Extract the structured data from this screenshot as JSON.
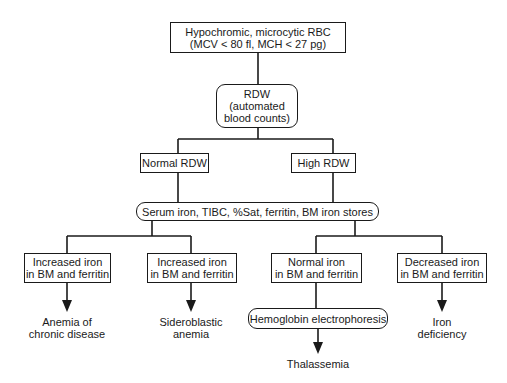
{
  "diagram": {
    "root": {
      "line1": "Hypochromic, microcytic RBC",
      "line2": "(MCV < 80 fl, MCH < 27 pg)"
    },
    "rdw": {
      "line1": "RDW",
      "line2": "(automated",
      "line3": "blood counts)"
    },
    "branches": {
      "normal": "Normal RDW",
      "high": "High RDW"
    },
    "tests": "Serum iron, TIBC, %Sat, ferritin, BM iron stores",
    "findings": [
      {
        "line1": "Increased iron",
        "line2": "in BM and ferritin",
        "outcome_line1": "Anemia of",
        "outcome_line2": "chronic disease"
      },
      {
        "line1": "Increased iron",
        "line2": "in BM and ferritin",
        "outcome_line1": "Sideroblastic",
        "outcome_line2": "anemia"
      },
      {
        "line1": "Normal iron",
        "line2": "in BM and ferritin",
        "next_test": "Hemoglobin electrophoresis",
        "outcome_line1": "Thalassemia"
      },
      {
        "line1": "Decreased iron",
        "line2": "in BM and ferritin",
        "outcome_line1": "Iron",
        "outcome_line2": "deficiency"
      }
    ]
  }
}
